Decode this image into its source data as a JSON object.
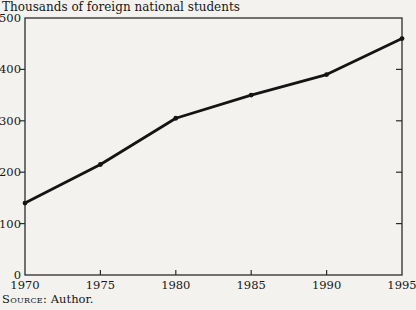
{
  "title": "Thousands of foreign national students",
  "source": {
    "label": "Source:",
    "value": "Author."
  },
  "colors": {
    "background": "#f3f2ee",
    "line": "#141414",
    "frame": "#2b2b2b",
    "text": "#161616"
  },
  "chart_data": {
    "type": "line",
    "title": "Thousands of foreign national students",
    "x": [
      1970,
      1975,
      1980,
      1985,
      1990,
      1995
    ],
    "values": [
      140,
      215,
      305,
      350,
      390,
      460
    ],
    "xlabel": "",
    "ylabel": "Thousands of foreign national students",
    "xlim": [
      1970,
      1995
    ],
    "ylim": [
      0,
      500
    ],
    "xticks": [
      1970,
      1975,
      1980,
      1985,
      1990,
      1995
    ],
    "yticks": [
      0,
      100,
      200,
      300,
      400,
      500
    ],
    "grid": false,
    "legend": "none",
    "marker": "dot",
    "frame": "box"
  }
}
